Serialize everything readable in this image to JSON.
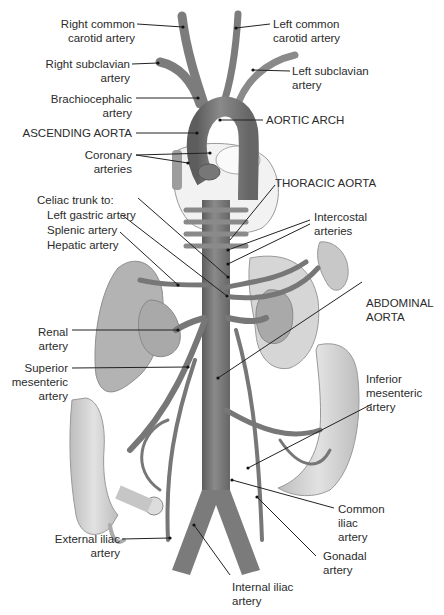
{
  "diagram": {
    "colors": {
      "artery": "#7d7d7d",
      "artery_dark": "#5e5e5e",
      "artery_light": "#a6a6a6",
      "organ": "#b9b9b9",
      "organ_light": "#d4d4d4",
      "heart": "#f1f1f1",
      "line": "#222222"
    },
    "labels": {
      "right_common_carotid": [
        "Right common",
        "carotid artery"
      ],
      "left_common_carotid": [
        "Left common",
        "carotid artery"
      ],
      "right_subclavian": [
        "Right subclavian",
        "artery"
      ],
      "left_subclavian": [
        "Left subclavian",
        "artery"
      ],
      "brachiocephalic": [
        "Brachiocephalic",
        "artery"
      ],
      "ascending_aorta": "ASCENDING AORTA",
      "aortic_arch": "AORTIC ARCH",
      "coronary": [
        "Coronary",
        "arteries"
      ],
      "thoracic_aorta": "THORACIC AORTA",
      "celiac_trunk": "Celiac trunk to:",
      "left_gastric": "Left gastric artery",
      "splenic": "Splenic artery",
      "hepatic": "Hepatic artery",
      "intercostal": [
        "Intercostal",
        "arteries"
      ],
      "renal": [
        "Renal",
        "artery"
      ],
      "abdominal_aorta": [
        "ABDOMINAL",
        "AORTA"
      ],
      "superior_mesenteric": [
        "Superior",
        "mesenteric",
        "artery"
      ],
      "inferior_mesenteric": [
        "Inferior",
        "mesenteric",
        "artery"
      ],
      "common_iliac": [
        "Common",
        "iliac",
        "artery"
      ],
      "gonadal": [
        "Gonadal",
        "artery"
      ],
      "external_iliac": [
        "External iliac",
        "artery"
      ],
      "internal_iliac": [
        "Internal iliac",
        "artery"
      ]
    }
  }
}
